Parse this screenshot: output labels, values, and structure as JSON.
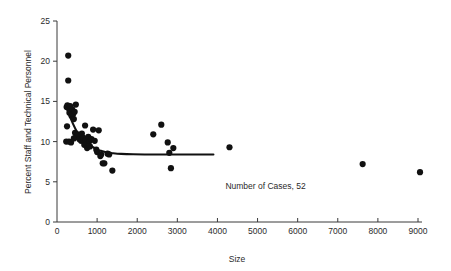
{
  "chart_data": {
    "type": "scatter",
    "title": "",
    "xlabel": "Size",
    "ylabel": "Percent Staff and Technical Personnel",
    "xlim": [
      0,
      9000
    ],
    "ylim": [
      0,
      25
    ],
    "xticks": [
      0,
      1000,
      2000,
      3000,
      4000,
      5000,
      6000,
      7000,
      8000,
      9000
    ],
    "xtick_labels": [
      "0",
      "1000",
      "2000",
      "3000",
      "4000",
      "5000",
      "6000",
      "7000",
      "8000",
      "9000"
    ],
    "yticks": [
      0,
      5,
      10,
      15,
      20,
      25
    ],
    "ytick_labels": [
      "0",
      "5",
      "10",
      "15",
      "20",
      "25"
    ],
    "grid": false,
    "legend": false,
    "annotations": [
      {
        "text": "Number of Cases, 52",
        "x": 5200,
        "y": 4.1
      }
    ],
    "marker": {
      "shape": "circle",
      "color": "#111111",
      "size": 3.1
    },
    "series": [
      {
        "name": "Establishments",
        "points": [
          [
            280,
            20.7
          ],
          [
            280,
            17.6
          ],
          [
            240,
            14.3
          ],
          [
            260,
            14.5
          ],
          [
            300,
            14.1
          ],
          [
            310,
            13.6
          ],
          [
            330,
            14.4
          ],
          [
            350,
            13.9
          ],
          [
            360,
            13.2
          ],
          [
            380,
            14.0
          ],
          [
            400,
            13.4
          ],
          [
            420,
            12.8
          ],
          [
            440,
            13.7
          ],
          [
            470,
            14.6
          ],
          [
            250,
            11.9
          ],
          [
            230,
            10.0
          ],
          [
            300,
            10.0
          ],
          [
            350,
            9.9
          ],
          [
            420,
            10.4
          ],
          [
            450,
            11.1
          ],
          [
            480,
            10.6
          ],
          [
            520,
            10.9
          ],
          [
            560,
            10.3
          ],
          [
            600,
            10.1
          ],
          [
            620,
            11.0
          ],
          [
            650,
            10.5
          ],
          [
            680,
            9.6
          ],
          [
            700,
            12.0
          ],
          [
            720,
            10.2
          ],
          [
            750,
            9.2
          ],
          [
            780,
            10.6
          ],
          [
            800,
            10.0
          ],
          [
            820,
            9.4
          ],
          [
            860,
            10.3
          ],
          [
            900,
            11.5
          ],
          [
            940,
            10.1
          ],
          [
            980,
            9.0
          ],
          [
            1000,
            8.7
          ],
          [
            1040,
            11.4
          ],
          [
            1080,
            8.2
          ],
          [
            1100,
            8.4
          ],
          [
            1140,
            7.3
          ],
          [
            1180,
            7.3
          ],
          [
            1260,
            8.5
          ],
          [
            1300,
            8.4
          ],
          [
            1380,
            6.4
          ],
          [
            2400,
            10.9
          ],
          [
            2600,
            12.1
          ],
          [
            2760,
            9.9
          ],
          [
            2800,
            8.6
          ],
          [
            2840,
            6.7
          ],
          [
            2900,
            9.2
          ],
          [
            4300,
            9.3
          ],
          [
            7620,
            7.2
          ],
          [
            9050,
            6.2
          ]
        ]
      }
    ],
    "fit_curve": {
      "name": "fitted-trend",
      "color": "#111111",
      "points": [
        [
          250,
          14.4
        ],
        [
          320,
          13.2
        ],
        [
          400,
          12.2
        ],
        [
          500,
          11.2
        ],
        [
          600,
          10.5
        ],
        [
          700,
          10.0
        ],
        [
          800,
          9.6
        ],
        [
          900,
          9.3
        ],
        [
          1000,
          9.0
        ],
        [
          1100,
          8.85
        ],
        [
          1250,
          8.65
        ],
        [
          1400,
          8.55
        ],
        [
          1600,
          8.47
        ],
        [
          1900,
          8.42
        ],
        [
          2300,
          8.4
        ],
        [
          2800,
          8.4
        ],
        [
          3300,
          8.4
        ],
        [
          3900,
          8.4
        ]
      ]
    }
  },
  "figure": {
    "background_color": "#ffffff",
    "axis_color": "#3a3a3a",
    "marker_color": "#111111"
  }
}
